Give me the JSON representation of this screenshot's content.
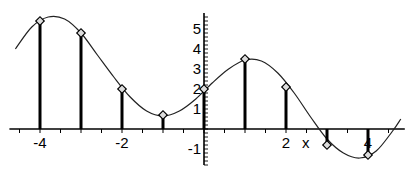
{
  "chart_data": {
    "type": "line",
    "title": "",
    "xlabel": "x",
    "ylabel": "",
    "xlim": [
      -4.6,
      4.8
    ],
    "ylim": [
      -1.8,
      5.8
    ],
    "grid": false,
    "x_tick_labels": [
      "-4",
      "-2",
      "2",
      "4"
    ],
    "y_tick_labels": [
      "5",
      "4",
      "3",
      "2",
      "1",
      "-1"
    ],
    "series": [
      {
        "name": "curve",
        "style": "smooth line",
        "x": [
          -4.6,
          -4.2,
          -3.8,
          -3.4,
          -3.0,
          -2.6,
          -2.2,
          -1.8,
          -1.4,
          -1.0,
          -0.6,
          -0.2,
          0.2,
          0.6,
          1.0,
          1.4,
          1.8,
          2.2,
          2.6,
          3.0,
          3.4,
          3.8,
          4.2,
          4.6,
          4.8
        ],
        "y": [
          4.0,
          5.1,
          5.6,
          5.5,
          4.8,
          3.7,
          2.6,
          1.6,
          0.9,
          0.65,
          0.9,
          1.5,
          2.3,
          3.0,
          3.45,
          3.4,
          2.8,
          1.8,
          0.6,
          -0.5,
          -1.2,
          -1.45,
          -1.1,
          -0.1,
          0.5
        ]
      },
      {
        "name": "stems",
        "style": "stem",
        "x": [
          -4,
          -3,
          -2,
          -1,
          0,
          1,
          2,
          3,
          4
        ],
        "y": [
          5.4,
          4.8,
          2.0,
          0.7,
          2.0,
          3.5,
          2.1,
          -0.8,
          -1.3
        ]
      }
    ]
  }
}
